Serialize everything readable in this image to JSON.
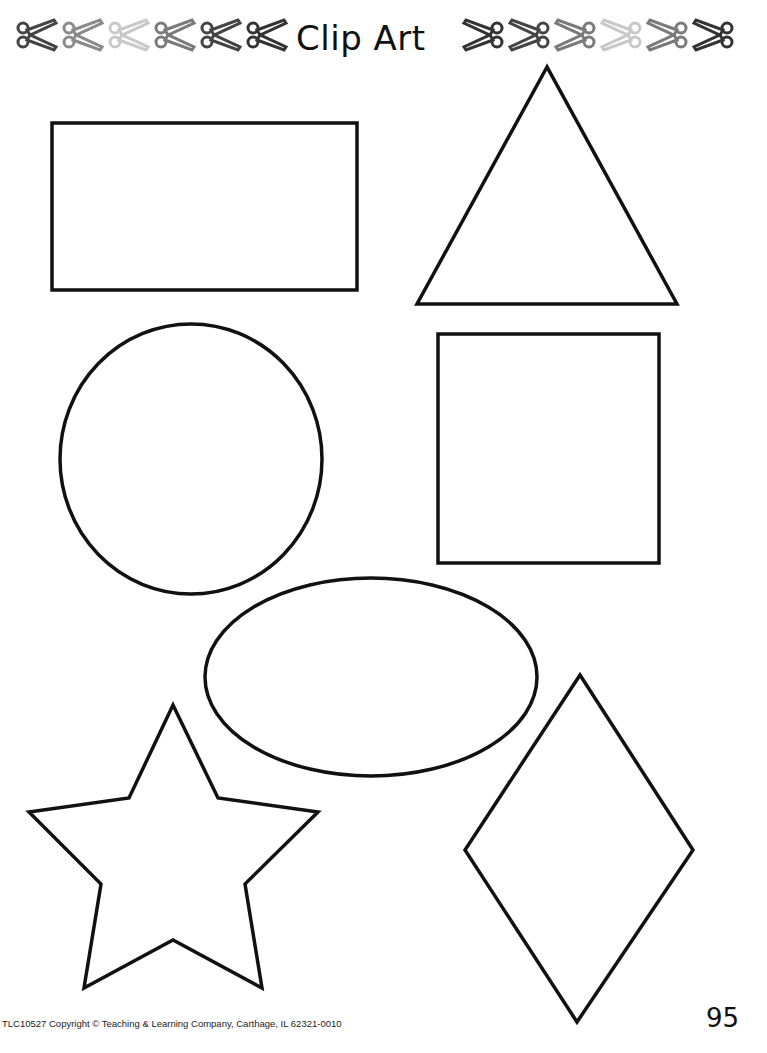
{
  "header": {
    "title": "Clip Art",
    "left_scissors": [
      {
        "icon": "scissors-icon",
        "color": "#444444"
      },
      {
        "icon": "scissors-icon",
        "color": "#8a8a8a"
      },
      {
        "icon": "scissors-icon",
        "color": "#c8c8c8"
      },
      {
        "icon": "scissors-icon",
        "color": "#7a7a7a"
      },
      {
        "icon": "scissors-icon",
        "color": "#444444"
      },
      {
        "icon": "scissors-icon",
        "color": "#333333"
      }
    ],
    "right_scissors": [
      {
        "icon": "scissors-icon",
        "color": "#333333"
      },
      {
        "icon": "scissors-icon",
        "color": "#444444"
      },
      {
        "icon": "scissors-icon",
        "color": "#7a7a7a"
      },
      {
        "icon": "scissors-icon",
        "color": "#c8c8c8"
      },
      {
        "icon": "scissors-icon",
        "color": "#7a7a7a"
      },
      {
        "icon": "scissors-icon",
        "color": "#333333"
      }
    ]
  },
  "shapes": [
    "rectangle",
    "triangle",
    "circle",
    "square",
    "oval",
    "star",
    "diamond"
  ],
  "footer": {
    "copyright": "TLC10527 Copyright © Teaching & Learning Company, Carthage, IL  62321-0010",
    "page_number": "95"
  }
}
